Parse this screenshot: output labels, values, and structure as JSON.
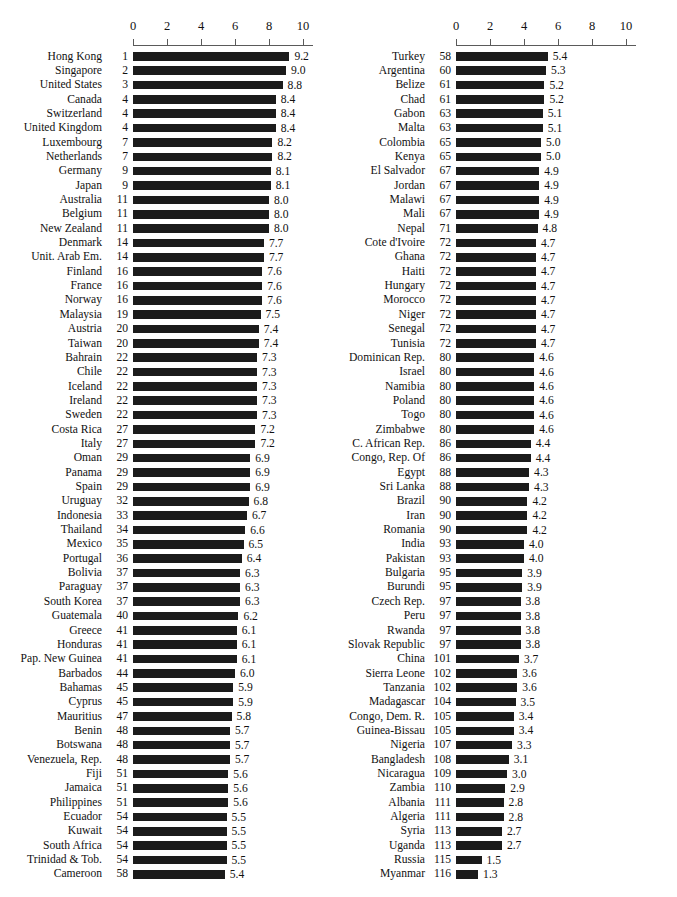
{
  "figure": {
    "title_partial": "",
    "axis": {
      "ticks": [
        0,
        2,
        4,
        6,
        8,
        10
      ],
      "min": 0,
      "max": 10,
      "tick_labels": [
        "0",
        "2",
        "4",
        "6",
        "8",
        "10"
      ]
    }
  },
  "chart_data": {
    "type": "bar",
    "orientation": "horizontal",
    "title": "",
    "xlabel": "",
    "ylabel": "",
    "xlim": [
      0,
      10
    ],
    "grid": false,
    "legend": null,
    "columns": [
      "Country",
      "Rank",
      "Score"
    ],
    "panels": [
      {
        "name": "left-panel",
        "axis_ticks": [
          0,
          2,
          4,
          6,
          8,
          10
        ],
        "rows": [
          {
            "name": "Hong Kong",
            "rank": "1",
            "value": 9.2
          },
          {
            "name": "Singapore",
            "rank": "2",
            "value": 9.0
          },
          {
            "name": "United States",
            "rank": "3",
            "value": 8.8
          },
          {
            "name": "Canada",
            "rank": "4",
            "value": 8.4
          },
          {
            "name": "Switzerland",
            "rank": "4",
            "value": 8.4
          },
          {
            "name": "United Kingdom",
            "rank": "4",
            "value": 8.4
          },
          {
            "name": "Luxembourg",
            "rank": "7",
            "value": 8.2
          },
          {
            "name": "Netherlands",
            "rank": "7",
            "value": 8.2
          },
          {
            "name": "Germany",
            "rank": "9",
            "value": 8.1
          },
          {
            "name": "Japan",
            "rank": "9",
            "value": 8.1
          },
          {
            "name": "Australia",
            "rank": "11",
            "value": 8.0
          },
          {
            "name": "Belgium",
            "rank": "11",
            "value": 8.0
          },
          {
            "name": "New Zealand",
            "rank": "11",
            "value": 8.0
          },
          {
            "name": "Denmark",
            "rank": "14",
            "value": 7.7
          },
          {
            "name": "Unit. Arab Em.",
            "rank": "14",
            "value": 7.7
          },
          {
            "name": "Finland",
            "rank": "16",
            "value": 7.6
          },
          {
            "name": "France",
            "rank": "16",
            "value": 7.6
          },
          {
            "name": "Norway",
            "rank": "16",
            "value": 7.6
          },
          {
            "name": "Malaysia",
            "rank": "19",
            "value": 7.5
          },
          {
            "name": "Austria",
            "rank": "20",
            "value": 7.4
          },
          {
            "name": "Taiwan",
            "rank": "20",
            "value": 7.4
          },
          {
            "name": "Bahrain",
            "rank": "22",
            "value": 7.3
          },
          {
            "name": "Chile",
            "rank": "22",
            "value": 7.3
          },
          {
            "name": "Iceland",
            "rank": "22",
            "value": 7.3
          },
          {
            "name": "Ireland",
            "rank": "22",
            "value": 7.3
          },
          {
            "name": "Sweden",
            "rank": "22",
            "value": 7.3
          },
          {
            "name": "Costa Rica",
            "rank": "27",
            "value": 7.2
          },
          {
            "name": "Italy",
            "rank": "27",
            "value": 7.2
          },
          {
            "name": "Oman",
            "rank": "29",
            "value": 6.9
          },
          {
            "name": "Panama",
            "rank": "29",
            "value": 6.9
          },
          {
            "name": "Spain",
            "rank": "29",
            "value": 6.9
          },
          {
            "name": "Uruguay",
            "rank": "32",
            "value": 6.8
          },
          {
            "name": "Indonesia",
            "rank": "33",
            "value": 6.7
          },
          {
            "name": "Thailand",
            "rank": "34",
            "value": 6.6
          },
          {
            "name": "Mexico",
            "rank": "35",
            "value": 6.5
          },
          {
            "name": "Portugal",
            "rank": "36",
            "value": 6.4
          },
          {
            "name": "Bolivia",
            "rank": "37",
            "value": 6.3
          },
          {
            "name": "Paraguay",
            "rank": "37",
            "value": 6.3
          },
          {
            "name": "South Korea",
            "rank": "37",
            "value": 6.3
          },
          {
            "name": "Guatemala",
            "rank": "40",
            "value": 6.2
          },
          {
            "name": "Greece",
            "rank": "41",
            "value": 6.1
          },
          {
            "name": "Honduras",
            "rank": "41",
            "value": 6.1
          },
          {
            "name": "Pap. New Guinea",
            "rank": "41",
            "value": 6.1
          },
          {
            "name": "Barbados",
            "rank": "44",
            "value": 6.0
          },
          {
            "name": "Bahamas",
            "rank": "45",
            "value": 5.9
          },
          {
            "name": "Cyprus",
            "rank": "45",
            "value": 5.9
          },
          {
            "name": "Mauritius",
            "rank": "47",
            "value": 5.8
          },
          {
            "name": "Benin",
            "rank": "48",
            "value": 5.7
          },
          {
            "name": "Botswana",
            "rank": "48",
            "value": 5.7
          },
          {
            "name": "Venezuela, Rep.",
            "rank": "48",
            "value": 5.7
          },
          {
            "name": "Fiji",
            "rank": "51",
            "value": 5.6
          },
          {
            "name": "Jamaica",
            "rank": "51",
            "value": 5.6
          },
          {
            "name": "Philippines",
            "rank": "51",
            "value": 5.6
          },
          {
            "name": "Ecuador",
            "rank": "54",
            "value": 5.5
          },
          {
            "name": "Kuwait",
            "rank": "54",
            "value": 5.5
          },
          {
            "name": "South Africa",
            "rank": "54",
            "value": 5.5
          },
          {
            "name": "Trinidad & Tob.",
            "rank": "54",
            "value": 5.5
          },
          {
            "name": "Cameroon",
            "rank": "58",
            "value": 5.4
          }
        ]
      },
      {
        "name": "right-panel",
        "axis_ticks": [
          0,
          2,
          4,
          6,
          8,
          10
        ],
        "rows": [
          {
            "name": "Turkey",
            "rank": "58",
            "value": 5.4
          },
          {
            "name": "Argentina",
            "rank": "60",
            "value": 5.3
          },
          {
            "name": "Belize",
            "rank": "61",
            "value": 5.2
          },
          {
            "name": "Chad",
            "rank": "61",
            "value": 5.2
          },
          {
            "name": "Gabon",
            "rank": "63",
            "value": 5.1
          },
          {
            "name": "Malta",
            "rank": "63",
            "value": 5.1
          },
          {
            "name": "Colombia",
            "rank": "65",
            "value": 5.0
          },
          {
            "name": "Kenya",
            "rank": "65",
            "value": 5.0
          },
          {
            "name": "El Salvador",
            "rank": "67",
            "value": 4.9
          },
          {
            "name": "Jordan",
            "rank": "67",
            "value": 4.9
          },
          {
            "name": "Malawi",
            "rank": "67",
            "value": 4.9
          },
          {
            "name": "Mali",
            "rank": "67",
            "value": 4.9
          },
          {
            "name": "Nepal",
            "rank": "71",
            "value": 4.8
          },
          {
            "name": "Cote d'Ivoire",
            "rank": "72",
            "value": 4.7
          },
          {
            "name": "Ghana",
            "rank": "72",
            "value": 4.7
          },
          {
            "name": "Haiti",
            "rank": "72",
            "value": 4.7
          },
          {
            "name": "Hungary",
            "rank": "72",
            "value": 4.7
          },
          {
            "name": "Morocco",
            "rank": "72",
            "value": 4.7
          },
          {
            "name": "Niger",
            "rank": "72",
            "value": 4.7
          },
          {
            "name": "Senegal",
            "rank": "72",
            "value": 4.7
          },
          {
            "name": "Tunisia",
            "rank": "72",
            "value": 4.7
          },
          {
            "name": "Dominican Rep.",
            "rank": "80",
            "value": 4.6
          },
          {
            "name": "Israel",
            "rank": "80",
            "value": 4.6
          },
          {
            "name": "Namibia",
            "rank": "80",
            "value": 4.6
          },
          {
            "name": "Poland",
            "rank": "80",
            "value": 4.6
          },
          {
            "name": "Togo",
            "rank": "80",
            "value": 4.6
          },
          {
            "name": "Zimbabwe",
            "rank": "80",
            "value": 4.6
          },
          {
            "name": "C. African Rep.",
            "rank": "86",
            "value": 4.4
          },
          {
            "name": "Congo, Rep. Of",
            "rank": "86",
            "value": 4.4
          },
          {
            "name": "Egypt",
            "rank": "88",
            "value": 4.3
          },
          {
            "name": "Sri Lanka",
            "rank": "88",
            "value": 4.3
          },
          {
            "name": "Brazil",
            "rank": "90",
            "value": 4.2
          },
          {
            "name": "Iran",
            "rank": "90",
            "value": 4.2
          },
          {
            "name": "Romania",
            "rank": "90",
            "value": 4.2
          },
          {
            "name": "India",
            "rank": "93",
            "value": 4.0
          },
          {
            "name": "Pakistan",
            "rank": "93",
            "value": 4.0
          },
          {
            "name": "Bulgaria",
            "rank": "95",
            "value": 3.9
          },
          {
            "name": "Burundi",
            "rank": "95",
            "value": 3.9
          },
          {
            "name": "Czech Rep.",
            "rank": "97",
            "value": 3.8
          },
          {
            "name": "Peru",
            "rank": "97",
            "value": 3.8
          },
          {
            "name": "Rwanda",
            "rank": "97",
            "value": 3.8
          },
          {
            "name": "Slovak Republic",
            "rank": "97",
            "value": 3.8
          },
          {
            "name": "China",
            "rank": "101",
            "value": 3.7
          },
          {
            "name": "Sierra Leone",
            "rank": "102",
            "value": 3.6
          },
          {
            "name": "Tanzania",
            "rank": "102",
            "value": 3.6
          },
          {
            "name": "Madagascar",
            "rank": "104",
            "value": 3.5
          },
          {
            "name": "Congo, Dem. R.",
            "rank": "105",
            "value": 3.4
          },
          {
            "name": "Guinea-Bissau",
            "rank": "105",
            "value": 3.4
          },
          {
            "name": "Nigeria",
            "rank": "107",
            "value": 3.3
          },
          {
            "name": "Bangladesh",
            "rank": "108",
            "value": 3.1
          },
          {
            "name": "Nicaragua",
            "rank": "109",
            "value": 3.0
          },
          {
            "name": "Zambia",
            "rank": "110",
            "value": 2.9
          },
          {
            "name": "Albania",
            "rank": "111",
            "value": 2.8
          },
          {
            "name": "Algeria",
            "rank": "111",
            "value": 2.8
          },
          {
            "name": "Syria",
            "rank": "113",
            "value": 2.7
          },
          {
            "name": "Uganda",
            "rank": "113",
            "value": 2.7
          },
          {
            "name": "Russia",
            "rank": "115",
            "value": 1.5
          },
          {
            "name": "Myanmar",
            "rank": "116",
            "value": 1.3
          }
        ]
      }
    ]
  }
}
